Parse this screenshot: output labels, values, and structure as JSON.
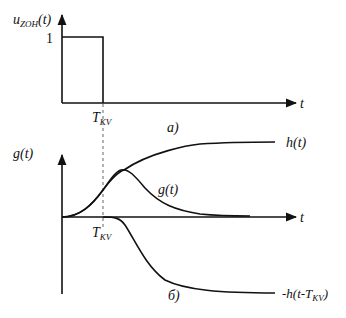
{
  "figure": {
    "panel_a": {
      "y_axis_label_main": "u",
      "y_axis_label_sub": "ZOH",
      "y_axis_label_arg": "(t)",
      "y_tick_label": "1",
      "x_axis_label": "t",
      "pulse_end_label_main": "T",
      "pulse_end_label_sub": "KV",
      "caption": "а)"
    },
    "panel_b": {
      "y_axis_label": "g(t)",
      "x_axis_label": "t",
      "tkv_label_main": "T",
      "tkv_label_sub": "KV",
      "curve_labels": {
        "h": "h(t)",
        "g": "g(t)",
        "neg_h_shift_prefix": "-h(t-T",
        "neg_h_shift_sub": "KV",
        "neg_h_shift_suffix": ")"
      },
      "caption": "б)"
    },
    "colors": {
      "line": "#111111",
      "dashed": "#666666",
      "background": "#ffffff"
    }
  }
}
